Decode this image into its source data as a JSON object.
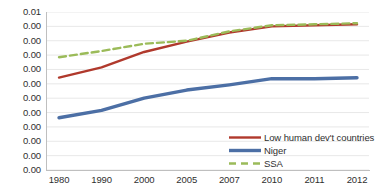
{
  "chart_data": {
    "type": "line",
    "title": "",
    "subtitle": "",
    "xlabel": "",
    "ylabel": "",
    "categories": [
      "1980",
      "1990",
      "2000",
      "2005",
      "2007",
      "2010",
      "2011",
      "2012"
    ],
    "ylim": [
      0.0,
      0.01
    ],
    "xlim_labels": [
      "1980",
      "2012"
    ],
    "grid": true,
    "grid_orientation": "horizontal",
    "legend_position": "bottom-right",
    "y_tick_labels": [
      "0.01",
      "0.00",
      "0.00",
      "0.00",
      "0.00",
      "0.00",
      "0.00",
      "0.00",
      "0.00",
      "0.00",
      "0.00",
      "0.00"
    ],
    "y_tick_values": [
      0.01,
      0.0091,
      0.0082,
      0.0073,
      0.0064,
      0.0055,
      0.0045,
      0.0036,
      0.0027,
      0.0018,
      0.0009,
      0.0
    ],
    "x_tick_labels": [
      "1980",
      "1990",
      "2000",
      "2005",
      "2007",
      "2010",
      "2011",
      "2012"
    ],
    "series": [
      {
        "name": "Low human dev't countries",
        "color": "#b0392c",
        "style": "solid",
        "values": [
          0.00585,
          0.0065,
          0.00747,
          0.00812,
          0.0087,
          0.00909,
          0.00916,
          0.00922
        ]
      },
      {
        "name": "Niger",
        "color": "#4c6fa5",
        "style": "solid",
        "values": [
          0.00331,
          0.00377,
          0.00455,
          0.00506,
          0.00539,
          0.00578,
          0.00578,
          0.00584
        ]
      },
      {
        "name": "SSA",
        "color": "#9bbb59",
        "style": "dashed",
        "values": [
          0.00714,
          0.00753,
          0.00799,
          0.00818,
          0.00877,
          0.00916,
          0.00922,
          0.00929
        ]
      }
    ]
  },
  "legend": {
    "items": [
      {
        "label": "Low human dev't countries",
        "color": "#b0392c",
        "style": "solid"
      },
      {
        "label": "Niger",
        "color": "#4c6fa5",
        "style": "solid"
      },
      {
        "label": "SSA",
        "color": "#9bbb59",
        "style": "dashed"
      }
    ]
  }
}
